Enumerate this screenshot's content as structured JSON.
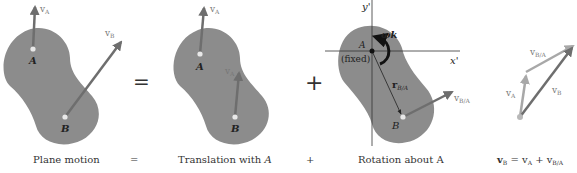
{
  "diagram": {
    "colors": {
      "body_fill": "#8c8c8c",
      "vector_dark": "#6e6e6e",
      "vector_light": "#a8a8a8",
      "axis": "#333333",
      "point": "#e8e8e8"
    },
    "panels": [
      {
        "caption": "Plane motion",
        "points": [
          "A",
          "B"
        ],
        "vectors": [
          "vA",
          "vB"
        ]
      },
      {
        "caption": "Translation with A",
        "points": [
          "A",
          "B"
        ],
        "vectors": [
          "vA",
          "vA"
        ]
      },
      {
        "caption": "Rotation about A",
        "points": [
          "A",
          "B"
        ],
        "vectors": [
          "vB/A"
        ],
        "axes": [
          "x'",
          "y'"
        ],
        "angular_velocity": "ωk",
        "position_vector": "rB/A",
        "fixed_note": "(fixed)"
      },
      {
        "caption": "vB = vA + vB/A",
        "vectors": [
          "vA",
          "vB",
          "vB/A"
        ]
      }
    ],
    "operators": {
      "equals": "=",
      "plus": "+"
    },
    "labels": {
      "A": "A",
      "B": "B",
      "v": "v",
      "sub_A": "A",
      "sub_B": "B",
      "sub_BA": "B/A",
      "x_axis": "x'",
      "y_axis": "y'",
      "omega": "ωk",
      "r": "r",
      "fixed": "(fixed)"
    },
    "captions": {
      "plane_motion": "Plane motion",
      "equals_small": "=",
      "translation": "Translation with ",
      "translation_italic": "A",
      "plus_small": "+",
      "rotation": "Rotation about A",
      "eq_vB": "v",
      "eq_vB_sub": "B",
      "eq_eq": " = v",
      "eq_vA_sub": "A",
      "eq_plus": " + v",
      "eq_vBA_sub": "B/A"
    }
  }
}
